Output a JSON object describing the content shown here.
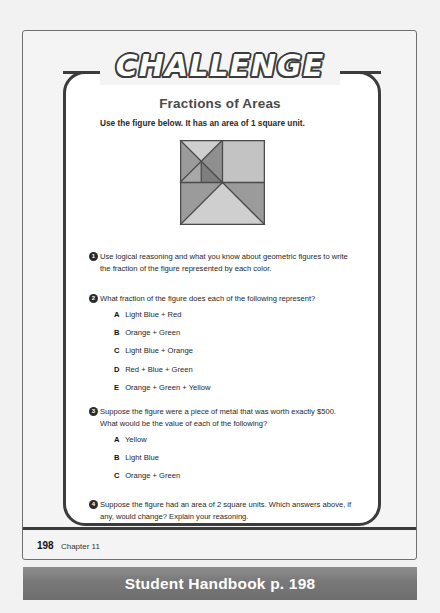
{
  "page": {
    "banner_label": "CHALLENGE",
    "title": "Fractions of Areas",
    "intro": "Use the figure below. It has an area of 1 square unit.",
    "footer_page_number": "198",
    "footer_chapter": "Chapter 11",
    "bottom_banner": "Student Handbook p. 198"
  },
  "figure": {
    "name": "fractions-of-areas-square",
    "colors": {
      "yellow": "#cfcfcf",
      "light_blue": "#c3c3c3",
      "orange": "#9b9b9b",
      "red": "#8f8f8f",
      "green": "#a8a8a8",
      "blue": "#7e7e7e",
      "outline": "#4a4a4a"
    }
  },
  "questions": [
    {
      "number": "1",
      "text": "Use logical reasoning and what you know about geometric figures to write the fraction of the figure represented by each color.",
      "options": []
    },
    {
      "number": "2",
      "text": "What fraction of the figure does each of the following represent?",
      "options": [
        {
          "letter": "A",
          "text": "Light Blue + Red"
        },
        {
          "letter": "B",
          "text": "Orange + Green"
        },
        {
          "letter": "C",
          "text": "Light Blue + Orange"
        },
        {
          "letter": "D",
          "text": "Red + Blue + Green"
        },
        {
          "letter": "E",
          "text": "Orange + Green + Yellow"
        }
      ]
    },
    {
      "number": "3",
      "text": "Suppose the figure were a piece of metal that was worth exactly $500. What would be the value of each of the following?",
      "options": [
        {
          "letter": "A",
          "text": "Yellow"
        },
        {
          "letter": "B",
          "text": "Light Blue"
        },
        {
          "letter": "C",
          "text": "Orange + Green"
        }
      ]
    },
    {
      "number": "4",
      "text": "Suppose the figure had an area of 2 square units. Which answers above, if any, would change? Explain your reasoning.",
      "options": []
    }
  ]
}
